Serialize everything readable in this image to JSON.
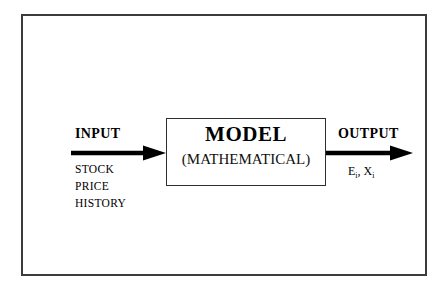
{
  "diagram": {
    "model_box": {
      "title": "MODEL",
      "subtitle": "(MATHEMATICAL)"
    },
    "input": {
      "label": "INPUT",
      "items": [
        "STOCK",
        "PRICE",
        "HISTORY"
      ]
    },
    "output": {
      "label": "OUTPUT",
      "variables_prefix_1": "E",
      "variables_subscript_1": "i",
      "variables_separator": ", ",
      "variables_prefix_2": "X",
      "variables_subscript_2": "i"
    },
    "arrows": {
      "input_arrow_name": "arrow-right-icon",
      "output_arrow_name": "arrow-right-icon"
    },
    "colors": {
      "frame_border": "#3c3c3c",
      "box_border": "#2e2e2e",
      "arrow": "#000000",
      "background": "#ffffff",
      "text": "#000000"
    }
  }
}
